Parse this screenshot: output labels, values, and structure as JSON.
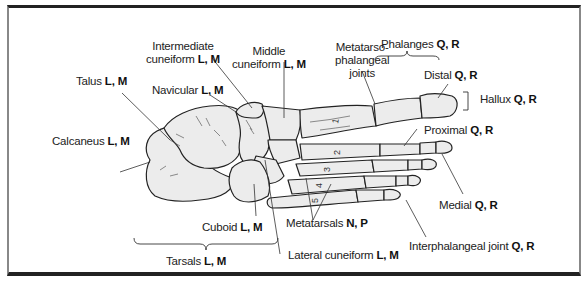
{
  "figure": {
    "labels": {
      "talus": {
        "name": "Talus",
        "codes": "L, M"
      },
      "intermediate_cuneiform": {
        "name_line1": "Intermediate",
        "name_line2": "cuneiform",
        "codes": "L, M"
      },
      "middle_cuneiform": {
        "name_line1": "Middle",
        "name_line2": "cuneiform",
        "codes": "L, M"
      },
      "navicular": {
        "name": "Navicular",
        "codes": "L, M"
      },
      "calcaneus": {
        "name": "Calcaneus",
        "codes": "L, M"
      },
      "cuboid": {
        "name": "Cuboid",
        "codes": "L, M"
      },
      "tarsals": {
        "name": "Tarsals",
        "codes": "L, M"
      },
      "lateral_cuneiform": {
        "name": "Lateral cuneiform",
        "codes": "L, M"
      },
      "metatarsals": {
        "name": "Metatarsals",
        "codes": "N, P"
      },
      "metatarsophalangeal": {
        "line1": "Metatarso-",
        "line2": "phalangeal",
        "line3": "joints"
      },
      "phalanges": {
        "name": "Phalanges",
        "codes": "Q, R"
      },
      "distal": {
        "name": "Distal",
        "codes": "Q, R"
      },
      "hallux": {
        "name": "Hallux",
        "codes": "Q, R"
      },
      "proximal": {
        "name": "Proximal",
        "codes": "Q, R"
      },
      "medial": {
        "name": "Medial",
        "codes": "Q, R"
      },
      "interphalangeal": {
        "name": "Interphalangeal joint",
        "codes": "Q, R"
      }
    },
    "metatarsal_numbers": [
      "1",
      "2",
      "3",
      "4",
      "5"
    ]
  }
}
